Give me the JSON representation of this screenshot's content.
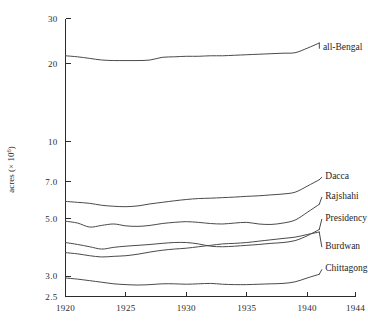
{
  "chart_data": {
    "type": "line",
    "title": "",
    "xlabel": "",
    "ylabel": "acres (× 10⁶)",
    "ylabel_main": "acres (",
    "ylabel_mult": "× 10",
    "ylabel_exp": "6",
    "ylabel_close": ")",
    "scale": "log",
    "grid": false,
    "legend_position": "right-inline",
    "xlim": [
      1920,
      1944
    ],
    "ylim": [
      2.5,
      30
    ],
    "x_ticks": [
      1920,
      1925,
      1930,
      1935,
      1940,
      1944
    ],
    "x_tick_labels": [
      "1920",
      "1925",
      "1930",
      "1935",
      "1940",
      "1944"
    ],
    "y_ticks": [
      2.5,
      3.0,
      5.0,
      7.0,
      10,
      20,
      30
    ],
    "y_tick_labels": [
      "2.5",
      "3.0",
      "5.0",
      "7.0",
      "10",
      "20",
      "30"
    ],
    "x": [
      1920,
      1921,
      1922,
      1923,
      1924,
      1925,
      1926,
      1927,
      1928,
      1929,
      1930,
      1931,
      1932,
      1933,
      1934,
      1935,
      1936,
      1937,
      1938,
      1939,
      1940,
      1941
    ],
    "series": [
      {
        "name": "all-Bengal",
        "label": "all-Bengal",
        "values": [
          21.5,
          21.3,
          21.0,
          20.7,
          20.6,
          20.6,
          20.6,
          20.7,
          21.2,
          21.3,
          21.4,
          21.4,
          21.5,
          21.5,
          21.6,
          21.7,
          21.8,
          21.9,
          22.0,
          22.1,
          23.0,
          24.1
        ],
        "label_x": 1941.3,
        "label_y": 23.3
      },
      {
        "name": "Dacca",
        "label": "Dacca",
        "values": [
          5.85,
          5.8,
          5.75,
          5.65,
          5.6,
          5.58,
          5.62,
          5.72,
          5.8,
          5.88,
          5.95,
          6.0,
          6.02,
          6.05,
          6.08,
          6.12,
          6.15,
          6.2,
          6.25,
          6.35,
          6.7,
          7.1
        ],
        "label_x": 1941.5,
        "label_y": 7.35
      },
      {
        "name": "Rajshahi",
        "label": "Rajshahi",
        "values": [
          4.9,
          4.82,
          4.65,
          4.72,
          4.78,
          4.7,
          4.68,
          4.72,
          4.8,
          4.85,
          4.88,
          4.85,
          4.8,
          4.78,
          4.82,
          4.85,
          4.78,
          4.76,
          4.82,
          4.95,
          5.3,
          5.7
        ],
        "label_x": 1941.5,
        "label_y": 6.15
      },
      {
        "name": "Presidency",
        "label": "Presidency",
        "values": [
          4.05,
          3.98,
          3.9,
          3.82,
          3.88,
          3.92,
          3.95,
          3.98,
          4.02,
          4.05,
          4.05,
          4.0,
          3.92,
          3.9,
          3.92,
          3.95,
          3.98,
          4.02,
          4.05,
          4.12,
          4.3,
          4.55
        ],
        "label_x": 1941.5,
        "label_y": 5.05
      },
      {
        "name": "Burdwan",
        "label": "Burdwan",
        "values": [
          3.7,
          3.66,
          3.6,
          3.56,
          3.58,
          3.6,
          3.65,
          3.72,
          3.78,
          3.82,
          3.85,
          3.9,
          3.95,
          4.0,
          4.02,
          4.05,
          4.1,
          4.15,
          4.2,
          4.25,
          4.35,
          4.45
        ],
        "label_x": 1941.5,
        "label_y": 3.95
      },
      {
        "name": "Chittagong",
        "label": "Chittagong",
        "values": [
          2.95,
          2.92,
          2.88,
          2.84,
          2.8,
          2.78,
          2.77,
          2.78,
          2.8,
          2.8,
          2.79,
          2.8,
          2.81,
          2.79,
          2.78,
          2.78,
          2.79,
          2.8,
          2.81,
          2.85,
          2.95,
          3.05
        ],
        "label_x": 1941.5,
        "label_y": 3.22
      }
    ]
  }
}
